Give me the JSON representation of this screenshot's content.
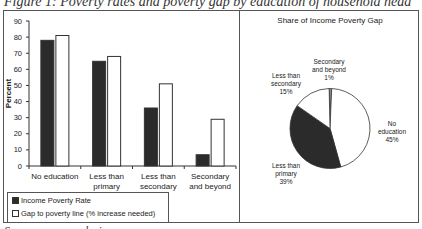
{
  "figure": {
    "caption": "Figure 1: Poverty rates and poverty gap by education of household head",
    "source": "Source: own analysis"
  },
  "chart_data": [
    {
      "type": "bar",
      "title": "",
      "xlabel": "",
      "ylabel": "Percent",
      "ylim": [
        0,
        90
      ],
      "yticks": [
        0,
        10,
        20,
        30,
        40,
        50,
        60,
        70,
        80,
        90
      ],
      "grid": false,
      "categories": [
        "No education",
        "Less than primary",
        "Less than secondary",
        "Secondary and beyond"
      ],
      "series": [
        {
          "name": "Income Poverty Rate",
          "color": "#2b2b2b",
          "values": [
            78,
            65,
            36,
            7
          ]
        },
        {
          "name": "Gap to poverty line (% increase needed)",
          "color": "#ffffff",
          "values": [
            81,
            68,
            51,
            29
          ]
        }
      ],
      "legend_position": "bottom-left"
    },
    {
      "type": "pie",
      "title": "Share of Income Poverty Gap",
      "slices": [
        {
          "label": "No education",
          "value": 45,
          "color": "#ffffff"
        },
        {
          "label": "Less than primary",
          "value": 39,
          "color": "#2b2b2b"
        },
        {
          "label": "Less than secondary",
          "value": 15,
          "color": "#ffffff"
        },
        {
          "label": "Secondary and beyond",
          "value": 1,
          "color": "#888888"
        }
      ]
    }
  ],
  "bar_chart": {
    "ylabel": "Percent",
    "yticks": [
      "0",
      "10",
      "20",
      "30",
      "40",
      "50",
      "60",
      "70",
      "80",
      "90"
    ],
    "categories": [
      {
        "line1": "No education",
        "line2": ""
      },
      {
        "line1": "Less than",
        "line2": "primary"
      },
      {
        "line1": "Less than",
        "line2": "secondary"
      },
      {
        "line1": "Secondary",
        "line2": "and beyond"
      }
    ],
    "legend": {
      "series1": "Income Poverty Rate",
      "series2": "Gap to poverty line (% increase needed)"
    }
  },
  "pie_chart": {
    "title": "Share of Income Poverty Gap",
    "labels": {
      "secondary": {
        "l1": "Secondary",
        "l2": "and beyond",
        "pct": "1%"
      },
      "less_secondary": {
        "l1": "Less than",
        "l2": "secondary",
        "pct": "15%"
      },
      "no_education": {
        "l1": "No",
        "l2": "education",
        "pct": "45%"
      },
      "less_primary": {
        "l1": "Less than",
        "l2": "primary",
        "pct": "39%"
      }
    }
  }
}
